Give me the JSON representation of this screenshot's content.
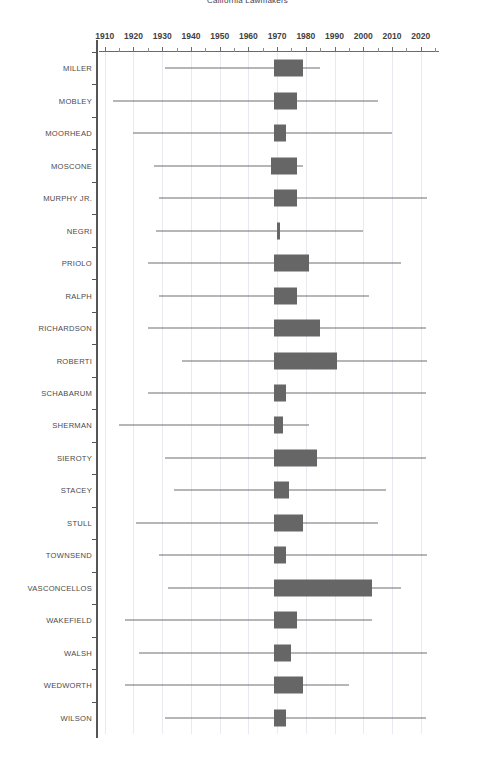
{
  "title": "California Lawmakers",
  "chart_data": {
    "type": "bar",
    "subtype": "box-whisker-horizontal",
    "title": "California Lawmakers",
    "xlabel": "",
    "ylabel": "",
    "xlim": [
      1908,
      2026
    ],
    "xticks": [
      1910,
      1920,
      1930,
      1940,
      1950,
      1960,
      1970,
      1980,
      1990,
      2000,
      2010,
      2020
    ],
    "xtick_labels": [
      "1910",
      "1920",
      "1930",
      "1940",
      "1950",
      "1960",
      "1970",
      "1980",
      "1990",
      "2000",
      "2010",
      "2020"
    ],
    "minor_tick_interval": 5,
    "grid": true,
    "grid_axis": "x",
    "legend": "none",
    "box_color": "#666666",
    "whisker_color": "#6f6f6f",
    "grid_color": "#e9e9ef",
    "categories": [
      "MILLER",
      "MOBLEY",
      "MOORHEAD",
      "MOSCONE",
      "MURPHY JR.",
      "NEGRI",
      "PRIOLO",
      "RALPH",
      "RICHARDSON",
      "ROBERTI",
      "SCHABARUM",
      "SHERMAN",
      "SIEROTY",
      "STACEY",
      "STULL",
      "TOWNSEND",
      "VASCONCELLOS",
      "WAKEFIELD",
      "WALSH",
      "WEDWORTH",
      "WILSON"
    ],
    "series": [
      {
        "name": "MILLER",
        "whisker_low": 1931,
        "box_low": 1969,
        "box_high": 1979,
        "whisker_high": 1985
      },
      {
        "name": "MOBLEY",
        "whisker_low": 1913,
        "box_low": 1969,
        "box_high": 1977,
        "whisker_high": 2005
      },
      {
        "name": "MOORHEAD",
        "whisker_low": 1920,
        "box_low": 1969,
        "box_high": 1973,
        "whisker_high": 2010
      },
      {
        "name": "MOSCONE",
        "whisker_low": 1927,
        "box_low": 1968,
        "box_high": 1977,
        "whisker_high": 1979
      },
      {
        "name": "MURPHY JR.",
        "whisker_low": 1929,
        "box_low": 1969,
        "box_high": 1977,
        "whisker_high": 2022
      },
      {
        "name": "NEGRI",
        "whisker_low": 1928,
        "box_low": 1970,
        "box_high": 1971,
        "whisker_high": 2000
      },
      {
        "name": "PRIOLO",
        "whisker_low": 1925,
        "box_low": 1969,
        "box_high": 1981,
        "whisker_high": 2013
      },
      {
        "name": "RALPH",
        "whisker_low": 1929,
        "box_low": 1969,
        "box_high": 1977,
        "whisker_high": 2002
      },
      {
        "name": "RICHARDSON",
        "whisker_low": 1925,
        "box_low": 1969,
        "box_high": 1985,
        "whisker_high": 2022
      },
      {
        "name": "ROBERTI",
        "whisker_low": 1937,
        "box_low": 1969,
        "box_high": 1991,
        "whisker_high": 2022
      },
      {
        "name": "SCHABARUM",
        "whisker_low": 1925,
        "box_low": 1969,
        "box_high": 1973,
        "whisker_high": 2022
      },
      {
        "name": "SHERMAN",
        "whisker_low": 1915,
        "box_low": 1969,
        "box_high": 1972,
        "whisker_high": 1981
      },
      {
        "name": "SIEROTY",
        "whisker_low": 1931,
        "box_low": 1969,
        "box_high": 1984,
        "whisker_high": 2022
      },
      {
        "name": "STACEY",
        "whisker_low": 1934,
        "box_low": 1969,
        "box_high": 1974,
        "whisker_high": 2008
      },
      {
        "name": "STULL",
        "whisker_low": 1921,
        "box_low": 1969,
        "box_high": 1979,
        "whisker_high": 2005
      },
      {
        "name": "TOWNSEND",
        "whisker_low": 1929,
        "box_low": 1969,
        "box_high": 1973,
        "whisker_high": 2022
      },
      {
        "name": "VASCONCELLOS",
        "whisker_low": 1932,
        "box_low": 1969,
        "box_high": 2003,
        "whisker_high": 2013
      },
      {
        "name": "WAKEFIELD",
        "whisker_low": 1917,
        "box_low": 1969,
        "box_high": 1977,
        "whisker_high": 2003
      },
      {
        "name": "WALSH",
        "whisker_low": 1922,
        "box_low": 1969,
        "box_high": 1975,
        "whisker_high": 2022
      },
      {
        "name": "WEDWORTH",
        "whisker_low": 1917,
        "box_low": 1969,
        "box_high": 1979,
        "whisker_high": 1995
      },
      {
        "name": "WILSON",
        "whisker_low": 1931,
        "box_low": 1969,
        "box_high": 1973,
        "whisker_high": 2022
      }
    ]
  }
}
